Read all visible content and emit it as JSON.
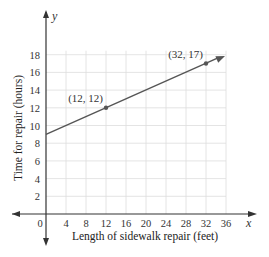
{
  "chart_data": {
    "type": "line",
    "title": "",
    "xlabel": "Length of sidewalk repair (feet)",
    "ylabel": "Time for repair (hours)",
    "x_var": "x",
    "y_var": "y",
    "xlim": [
      0,
      36
    ],
    "ylim": [
      0,
      18
    ],
    "x_ticks": [
      0,
      4,
      8,
      12,
      16,
      20,
      24,
      28,
      32,
      36
    ],
    "y_ticks": [
      2,
      4,
      6,
      8,
      10,
      12,
      14,
      16,
      18
    ],
    "grid": true,
    "series": [
      {
        "name": "repair time",
        "equation": "y = 0.25x + 9",
        "x": [
          0,
          12,
          32
        ],
        "y": [
          9,
          12,
          17
        ]
      }
    ],
    "points": [
      {
        "x": 12,
        "y": 12,
        "label": "(12, 12)"
      },
      {
        "x": 32,
        "y": 17,
        "label": "(32, 17)"
      }
    ],
    "legend": null
  },
  "labels": {
    "origin": "0",
    "x_var": "x",
    "y_var": "y",
    "xlabel": "Length of sidewalk repair (feet)",
    "ylabel": "Time for repair (hours)",
    "point1": "(12, 12)",
    "point2": "(32, 17)"
  },
  "colors": {
    "line": "#555555",
    "grid": "#dddddd",
    "axis": "#333333"
  }
}
